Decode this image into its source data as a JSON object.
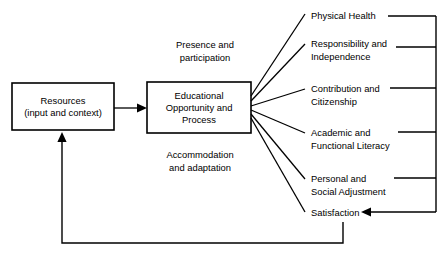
{
  "diagram": {
    "colors": {
      "stroke": "#000000",
      "background": "#ffffff",
      "text": "#000000"
    },
    "boxes": [
      {
        "id": "resources",
        "lines": [
          "Resources",
          "(input and context)"
        ],
        "x": 12,
        "y": 83,
        "width": 102,
        "height": 47
      },
      {
        "id": "educational-opportunity",
        "lines": [
          "Educational",
          "Opportunity and",
          "Process"
        ],
        "x": 147,
        "y": 82,
        "width": 104,
        "height": 51
      }
    ],
    "side_labels": [
      {
        "id": "presence-and-participation",
        "lines": [
          "Presence and",
          "participation"
        ],
        "x": 205,
        "y": 48
      },
      {
        "id": "accommodation-and-adaptation",
        "lines": [
          "Accommodation",
          "and adaptation"
        ],
        "x": 200,
        "y": 158
      }
    ],
    "outcomes": [
      {
        "id": "physical-health",
        "lines": [
          "Physical Health"
        ],
        "x": 311,
        "y": 19,
        "connector_y": 16,
        "connector_x_start": 388
      },
      {
        "id": "responsibility-and-independence",
        "lines": [
          "Responsibility and",
          "Independence"
        ],
        "x": 311,
        "y": 47,
        "connector_y": 47,
        "connector_x_start": 396
      },
      {
        "id": "contribution-and-citizenship",
        "lines": [
          "Contribution and",
          "Citizenship"
        ],
        "x": 311,
        "y": 92,
        "connector_y": 88,
        "connector_x_start": 390
      },
      {
        "id": "academic-and-functional-literacy",
        "lines": [
          "Academic and",
          "Functional Literacy"
        ],
        "x": 311,
        "y": 136,
        "connector_y": 132,
        "connector_x_start": 398
      },
      {
        "id": "personal-and-social-adjustment",
        "lines": [
          "Personal and",
          "Social Adjustment"
        ],
        "x": 311,
        "y": 182,
        "connector_y": 178,
        "connector_x_start": 394
      },
      {
        "id": "satisfaction",
        "lines": [
          "Satisfaction"
        ],
        "x": 311,
        "y": 216,
        "connector_y": 212,
        "connector_x_start": 436
      }
    ],
    "bus": {
      "id": "outcome-bus",
      "x": 436,
      "y_top": 16,
      "y_bottom": 212
    },
    "flow_arrow": {
      "id": "resources-to-process-arrow",
      "x_start": 114,
      "x_end": 147,
      "y": 108
    },
    "satisfaction_arrow": {
      "id": "satisfaction-inbound-arrow",
      "x_start": 436,
      "x_end": 361,
      "y": 212
    },
    "feedback": {
      "id": "feedback-loop",
      "x_drop": 343,
      "y_drop_start": 222,
      "y_bottom": 243,
      "x_left": 62,
      "y_arrow_top": 132
    },
    "fan": {
      "origin_x": 251,
      "origins_y": [
        96,
        101,
        106,
        110,
        114,
        118
      ],
      "targets": [
        {
          "x": 305,
          "y": 14
        },
        {
          "x": 305,
          "y": 44
        },
        {
          "x": 305,
          "y": 89
        },
        {
          "x": 305,
          "y": 133
        },
        {
          "x": 305,
          "y": 179
        },
        {
          "x": 305,
          "y": 212
        }
      ]
    }
  }
}
